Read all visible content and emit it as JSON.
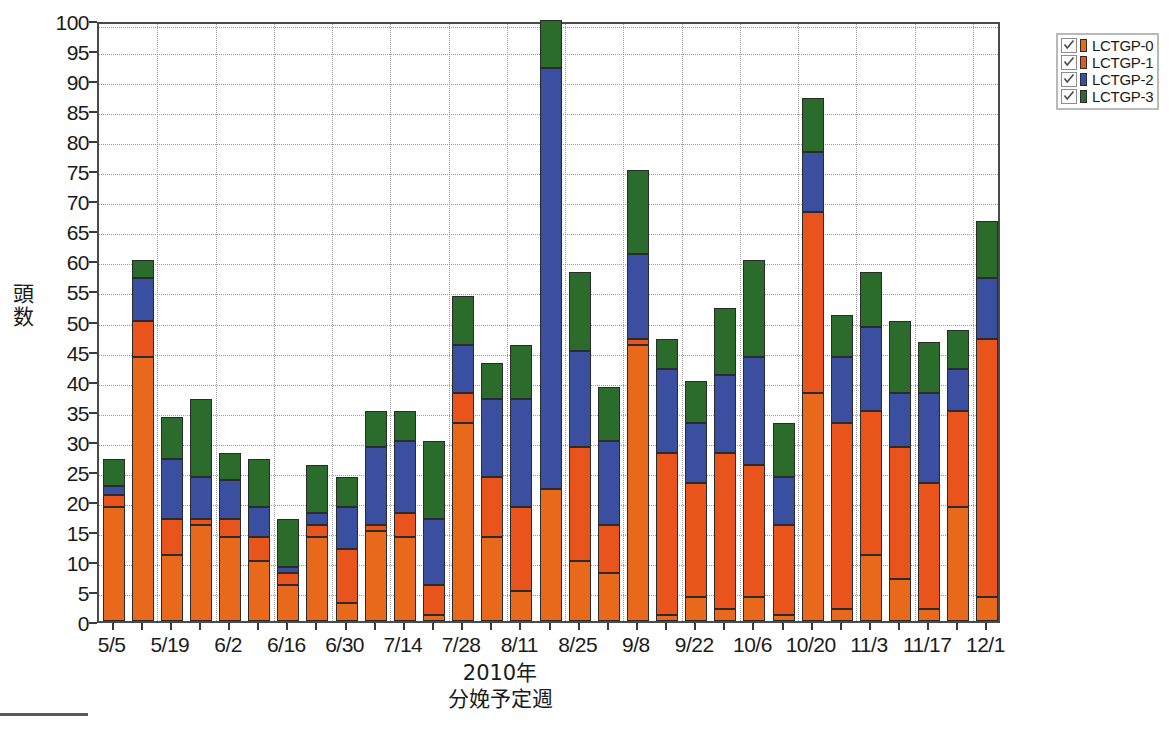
{
  "axes": {
    "y_title": "頭数",
    "x_title_line1": "2010年",
    "x_title_line2": "分娩予定週",
    "y_ticks": [
      0,
      5,
      10,
      15,
      20,
      25,
      30,
      35,
      40,
      45,
      50,
      55,
      60,
      65,
      70,
      75,
      80,
      85,
      90,
      95,
      100
    ]
  },
  "legend": {
    "items": [
      {
        "label": "LCTGP-0",
        "color": "#E8691C",
        "checked": true,
        "icon": "checkbox-checked-icon"
      },
      {
        "label": "LCTGP-1",
        "color": "#E8541C",
        "checked": true,
        "icon": "checkbox-checked-icon"
      },
      {
        "label": "LCTGP-2",
        "color": "#3A4FA0",
        "checked": true,
        "icon": "checkbox-checked-icon"
      },
      {
        "label": "LCTGP-3",
        "color": "#2B6B2B",
        "checked": true,
        "icon": "checkbox-checked-icon"
      }
    ]
  },
  "chart_data": {
    "type": "bar",
    "stacked": true,
    "title": "",
    "xlabel": "2010年 分娩予定週",
    "ylabel": "頭数",
    "ylim": [
      0,
      100
    ],
    "ytick_step": 5,
    "grid": true,
    "legend_position": "top-right",
    "categories": [
      "5/5",
      "5/12",
      "5/19",
      "5/26",
      "6/2",
      "6/9",
      "6/16",
      "6/23",
      "6/30",
      "7/7",
      "7/14",
      "7/21",
      "7/28",
      "8/4",
      "8/11",
      "8/18",
      "8/25",
      "9/1",
      "9/8",
      "9/15",
      "9/22",
      "9/29",
      "10/6",
      "10/13",
      "10/20",
      "10/27",
      "11/3",
      "11/10",
      "11/17",
      "11/24",
      "12/1"
    ],
    "tick_labels_shown": [
      "5/5",
      "5/19",
      "6/2",
      "6/16",
      "6/30",
      "7/14",
      "7/28",
      "8/11",
      "8/25",
      "9/8",
      "9/22",
      "10/6",
      "10/20",
      "11/3",
      "11/17",
      "12/1"
    ],
    "series": [
      {
        "name": "LCTGP-0",
        "color": "#E8691C",
        "values": [
          19,
          44,
          11,
          16,
          14,
          10,
          6,
          14,
          3,
          15,
          14,
          1,
          33,
          14,
          5,
          22,
          10,
          8,
          46,
          1,
          4,
          2,
          4,
          1,
          38,
          2,
          11,
          7,
          2,
          19,
          4
        ]
      },
      {
        "name": "LCTGP-1",
        "color": "#E8541C",
        "values": [
          21,
          50,
          17,
          17,
          17,
          14,
          8,
          16,
          12,
          16,
          18,
          6,
          38,
          24,
          19,
          22,
          29,
          16,
          47,
          28,
          23,
          28,
          26,
          16,
          68,
          33,
          35,
          29,
          23,
          35,
          47
        ]
      },
      {
        "name": "LCTGP-2",
        "color": "#3A4FA0",
        "values": [
          22.5,
          57,
          27,
          24,
          23.5,
          19,
          9,
          18,
          19,
          29,
          30,
          17,
          46,
          37,
          37,
          92,
          45,
          30,
          61,
          42,
          33,
          41,
          44,
          24,
          78,
          44,
          49,
          38,
          38,
          42,
          57
        ]
      },
      {
        "name": "LCTGP-3",
        "color": "#2B6B2B",
        "values": [
          27,
          60,
          34,
          37,
          28,
          27,
          17,
          26,
          24,
          35,
          35,
          30,
          54,
          43,
          46,
          100,
          58,
          39,
          75,
          47,
          40,
          52,
          60,
          33,
          87,
          51,
          58,
          50,
          46.5,
          48.5,
          66.5
        ]
      }
    ],
    "note": "Series values are cumulative stack tops (LCTGP-3 value equals total bar height)."
  }
}
